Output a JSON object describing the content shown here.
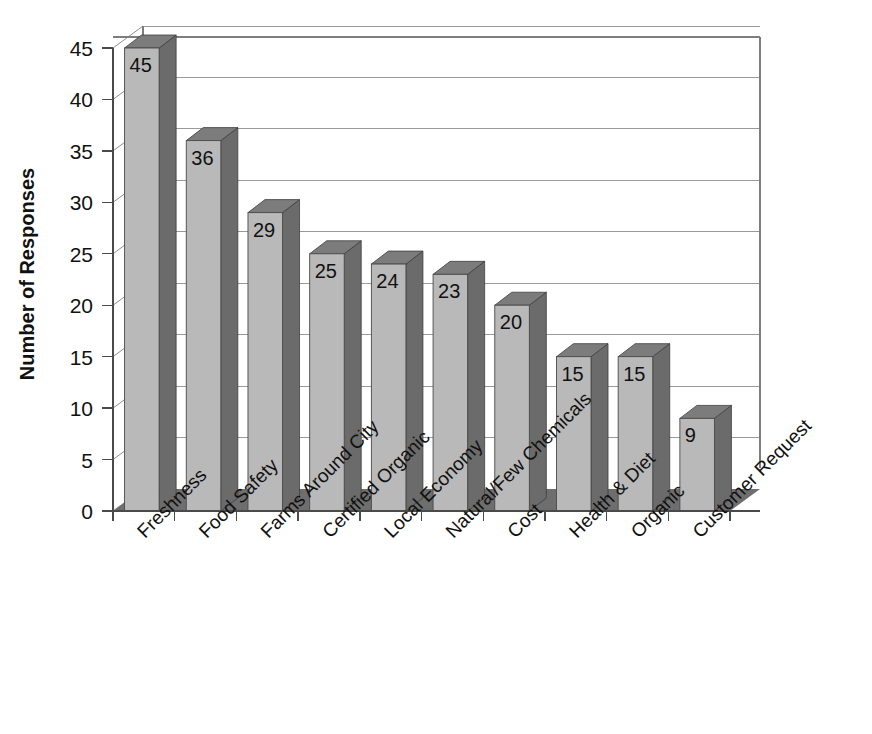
{
  "chart_data": {
    "type": "bar",
    "title": "",
    "subtitle": "",
    "xlabel": "",
    "ylabel": "Number of Responses",
    "categories": [
      "Freshness",
      "Food Safety",
      "Farms Around City",
      "Certified Organic",
      "Local Economy",
      "Natural/Few Chemicals",
      "Cost",
      "Health & Diet",
      "Organic",
      "Customer Request"
    ],
    "values": [
      45,
      36,
      29,
      25,
      24,
      23,
      20,
      15,
      15,
      9
    ],
    "data_labels": [
      "45",
      "36",
      "29",
      "25",
      "24",
      "23",
      "20",
      "15",
      "15",
      "9"
    ],
    "ylim": [
      0,
      45
    ],
    "ytick_values": [
      0,
      5,
      10,
      15,
      20,
      25,
      30,
      35,
      40,
      45
    ],
    "ytick_labels": [
      "0",
      "5",
      "10",
      "15",
      "20",
      "25",
      "30",
      "35",
      "40",
      "45"
    ],
    "grid": "horizontal",
    "legend": "none",
    "legend_position": "",
    "annotations": [],
    "style": {
      "three_d": true,
      "bar_front_color": "#b9b9b9",
      "bar_side_color": "#6b6b6b",
      "bar_top_color": "#7c7c7c",
      "floor_color": "#6e6e6e",
      "plot_background": "#ffffff",
      "gridline_color": "#9a9a9a",
      "frame_color": "#7d7d7d",
      "text_color": "#111111",
      "category_label_rotation": -45
    }
  },
  "figure": {
    "background_color": "#ffffff",
    "y_axis_title": "Number of Responses"
  }
}
